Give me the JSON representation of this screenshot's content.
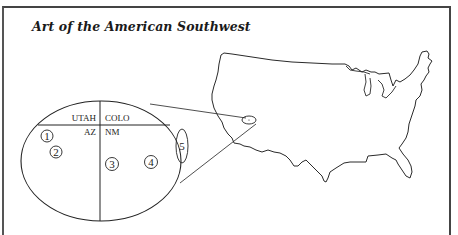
{
  "title": "Art of the American Southwest",
  "inset": {
    "state_labels": {
      "utah": "UTAH",
      "colo": "COLO",
      "az": "AZ",
      "nm": "NM"
    },
    "markers": [
      {
        "id": 1,
        "label": "1"
      },
      {
        "id": 2,
        "label": "2"
      },
      {
        "id": 3,
        "label": "3"
      },
      {
        "id": 4,
        "label": "4"
      },
      {
        "id": 5,
        "label": "5"
      }
    ]
  },
  "map": {
    "region": "United States (contiguous) outline",
    "highlight": "Four Corners area"
  },
  "colors": {
    "line": "#222222",
    "frame": "#444444",
    "background": "#ffffff"
  }
}
